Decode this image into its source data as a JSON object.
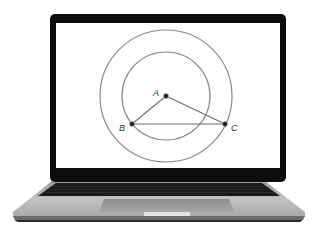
{
  "scene": {
    "description": "Laptop displaying geometry construction",
    "colors": {
      "background": "#ffffff",
      "bezel": "#0c0c0c",
      "screen": "#ffffff",
      "circle_stroke": "#8a8a8a",
      "segment_stroke": "#6e6e6e",
      "point_fill": "#1e1e1e",
      "body": "#b4b4b4",
      "keyboard": "#1a1a1a"
    }
  },
  "diagram": {
    "points": [
      {
        "id": "A",
        "label": "A",
        "x": 166,
        "y": 96
      },
      {
        "id": "B",
        "label": "B",
        "x": 132,
        "y": 124
      },
      {
        "id": "C",
        "label": "C",
        "x": 225,
        "y": 124
      }
    ],
    "circles": [
      {
        "name": "outer-circle",
        "cx": 166,
        "cy": 96,
        "r": 66
      },
      {
        "name": "inner-circle",
        "cx": 166,
        "cy": 96,
        "r": 44
      }
    ],
    "segments": [
      {
        "from": "A",
        "to": "B"
      },
      {
        "from": "A",
        "to": "C"
      },
      {
        "from": "B",
        "to": "C"
      }
    ]
  },
  "labels": {
    "A": "A",
    "B": "B",
    "C": "C"
  }
}
